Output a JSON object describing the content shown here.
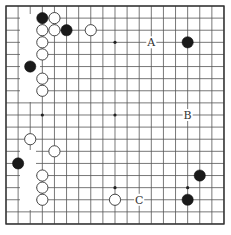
{
  "board": {
    "size": 19,
    "origin_x": 6,
    "origin_y": 6,
    "spacing": 12.11,
    "stone_radius": 5.6,
    "colors": {
      "line": "#555555",
      "black": "#1a1a1a",
      "white": "#ffffff",
      "label": "#333333"
    },
    "star_points": [
      [
        3,
        3
      ],
      [
        9,
        3
      ],
      [
        15,
        3
      ],
      [
        3,
        9
      ],
      [
        9,
        9
      ],
      [
        15,
        9
      ],
      [
        3,
        15
      ],
      [
        9,
        15
      ],
      [
        15,
        15
      ]
    ],
    "erased_regions": [
      {
        "x": 20,
        "y": 14,
        "w": 20,
        "h": 88
      },
      {
        "x": 20,
        "y": 150,
        "w": 16,
        "h": 60
      }
    ],
    "stones": [
      {
        "color": "black",
        "col": 3,
        "row": 1
      },
      {
        "color": "white",
        "col": 4,
        "row": 1
      },
      {
        "color": "white",
        "col": 3,
        "row": 2
      },
      {
        "color": "white",
        "col": 4,
        "row": 2
      },
      {
        "color": "black",
        "col": 5,
        "row": 2
      },
      {
        "color": "white",
        "col": 7,
        "row": 2
      },
      {
        "color": "white",
        "col": 3,
        "row": 3
      },
      {
        "color": "white",
        "col": 3,
        "row": 4
      },
      {
        "color": "black",
        "col": 2,
        "row": 5
      },
      {
        "color": "white",
        "col": 3,
        "row": 6
      },
      {
        "color": "white",
        "col": 3,
        "row": 7
      },
      {
        "color": "black",
        "col": 15,
        "row": 3
      },
      {
        "color": "white",
        "col": 2,
        "row": 11
      },
      {
        "color": "white",
        "col": 4,
        "row": 12
      },
      {
        "color": "black",
        "col": 1,
        "row": 13
      },
      {
        "color": "white",
        "col": 3,
        "row": 14
      },
      {
        "color": "white",
        "col": 3,
        "row": 15
      },
      {
        "color": "white",
        "col": 3,
        "row": 16
      },
      {
        "color": "black",
        "col": 16,
        "row": 14
      },
      {
        "color": "white",
        "col": 9,
        "row": 16
      },
      {
        "color": "black",
        "col": 15,
        "row": 16
      }
    ],
    "labels": [
      {
        "text": "A",
        "col": 12,
        "row": 3
      },
      {
        "text": "B",
        "col": 15,
        "row": 9
      },
      {
        "text": "C",
        "col": 11,
        "row": 16
      }
    ]
  }
}
